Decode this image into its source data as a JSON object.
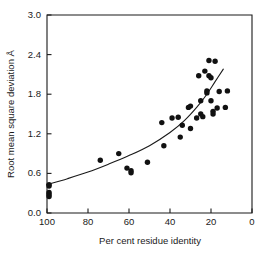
{
  "figure": {
    "background_color": "#ffffff",
    "foreground_color": "#1a1a1a"
  },
  "chart_data": {
    "type": "scatter",
    "title": "",
    "subtitle": "",
    "xlabel": "Per cent residue identity",
    "ylabel": "Root mean square deviation Å",
    "xlim": [
      100,
      0
    ],
    "ylim": [
      0.0,
      3.0
    ],
    "x_axis_reversed": true,
    "grid": false,
    "legend": false,
    "legend_position": "none",
    "xticks": [
      100,
      80,
      60,
      40,
      20,
      0
    ],
    "xtick_labels": [
      "100",
      "80",
      "60",
      "40",
      "20",
      "0"
    ],
    "yticks": [
      0.0,
      0.6,
      1.2,
      1.8,
      2.4,
      3.0
    ],
    "ytick_labels": [
      "0.0",
      "0.6",
      "1.2",
      "1.8",
      "2.4",
      "3.0"
    ],
    "marker": "filled-circle",
    "marker_color": "#111111",
    "marker_size_px": 5.4,
    "series": [
      {
        "name": "observed",
        "type": "scatter",
        "points": [
          [
            99,
            0.43
          ],
          [
            99,
            0.41
          ],
          [
            99,
            0.31
          ],
          [
            99,
            0.28
          ],
          [
            99,
            0.25
          ],
          [
            74,
            0.8
          ],
          [
            65,
            0.9
          ],
          [
            61,
            0.68
          ],
          [
            59,
            0.64
          ],
          [
            59,
            0.61
          ],
          [
            51,
            0.77
          ],
          [
            44,
            1.37
          ],
          [
            43,
            1.02
          ],
          [
            39,
            1.44
          ],
          [
            36,
            1.45
          ],
          [
            35,
            1.15
          ],
          [
            34,
            1.33
          ],
          [
            31,
            1.6
          ],
          [
            30,
            1.62
          ],
          [
            30,
            1.28
          ],
          [
            27,
            1.44
          ],
          [
            26,
            2.08
          ],
          [
            25,
            1.5
          ],
          [
            25,
            1.7
          ],
          [
            24,
            1.46
          ],
          [
            23,
            2.15
          ],
          [
            22,
            1.85
          ],
          [
            22,
            1.82
          ],
          [
            21,
            2.31
          ],
          [
            21,
            2.08
          ],
          [
            20,
            2.05
          ],
          [
            20,
            1.7
          ],
          [
            19,
            1.54
          ],
          [
            19,
            1.5
          ],
          [
            18,
            2.3
          ],
          [
            17,
            1.59
          ],
          [
            16,
            1.84
          ],
          [
            13,
            1.6
          ],
          [
            12,
            1.85
          ]
        ]
      },
      {
        "name": "fitted-curve",
        "type": "line",
        "line_color": "#1a1a1a",
        "line_width_px": 1.1,
        "points": [
          [
            100,
            0.43
          ],
          [
            90,
            0.52
          ],
          [
            80,
            0.62
          ],
          [
            70,
            0.74
          ],
          [
            60,
            0.87
          ],
          [
            50,
            1.02
          ],
          [
            40,
            1.22
          ],
          [
            33,
            1.4
          ],
          [
            27,
            1.6
          ],
          [
            22,
            1.8
          ],
          [
            18,
            1.99
          ],
          [
            14,
            2.18
          ]
        ]
      }
    ]
  },
  "geometry": {
    "plot_left_px": 47,
    "plot_right_px": 252,
    "plot_top_px": 15,
    "plot_bottom_px": 213
  }
}
